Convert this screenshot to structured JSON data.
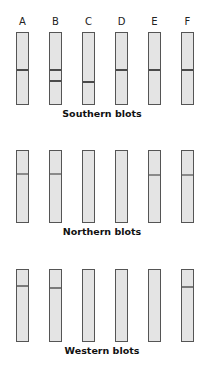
{
  "lanes": {
    "labels": [
      "A",
      "B",
      "C",
      "D",
      "E",
      "F"
    ],
    "x": [
      16,
      49,
      82,
      115,
      148,
      181
    ]
  },
  "colors": {
    "lane_fill": "#e4e4e4",
    "lane_border": "#555555",
    "band_dark": "#4a4a4a",
    "band_light": "#8a8a8a"
  },
  "panels": [
    {
      "caption": "Southern blots",
      "top": 32,
      "height": 71,
      "caption_y": 108,
      "band_color": "#4a4a4a",
      "bands": [
        [
          36
        ],
        [
          36,
          47
        ],
        [
          48
        ],
        [
          36
        ],
        [
          36
        ],
        [
          36
        ]
      ]
    },
    {
      "caption": "Northern blots",
      "top": 150,
      "height": 71,
      "caption_y": 226,
      "band_color": "#8a8a8a",
      "bands": [
        [
          22
        ],
        [
          22
        ],
        [],
        [],
        [
          23
        ],
        [
          23
        ]
      ]
    },
    {
      "caption": "Western blots",
      "top": 269,
      "height": 71,
      "caption_y": 345,
      "band_color": "#7a7a7a",
      "bands": [
        [
          15
        ],
        [
          17
        ],
        [],
        [],
        [],
        [
          16
        ]
      ]
    }
  ]
}
